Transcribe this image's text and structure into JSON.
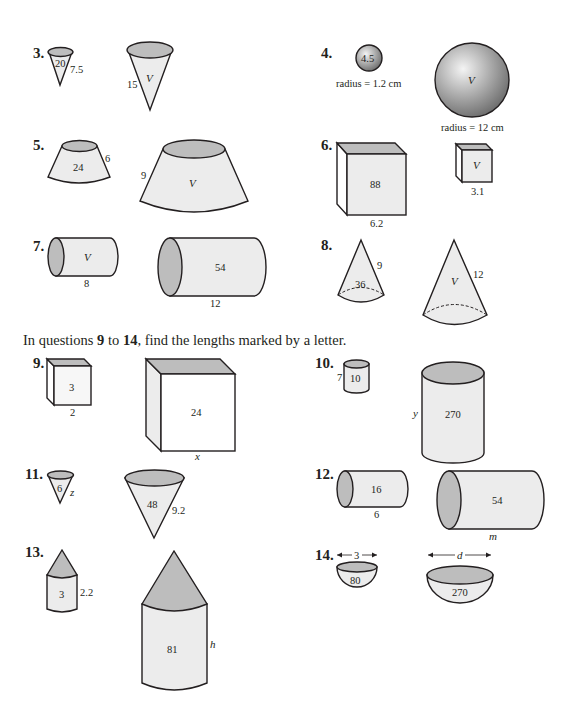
{
  "instruction": {
    "prefix": "In questions ",
    "from": "9",
    "middle": " to ",
    "to": "14",
    "suffix": ", find the lengths marked by a letter."
  },
  "questions": [
    {
      "number": "3.",
      "shape": "cone",
      "small": {
        "value": "20",
        "length": "7.5"
      },
      "large": {
        "value": "V",
        "length": "15"
      }
    },
    {
      "number": "4.",
      "shape": "sphere",
      "small": {
        "value": "4.5",
        "caption": "radius = 1.2 cm"
      },
      "large": {
        "value": "V",
        "caption": "radius = 12 cm"
      }
    },
    {
      "number": "5.",
      "shape": "frustum",
      "small": {
        "value": "24",
        "length": "6"
      },
      "large": {
        "value": "V",
        "length": "9"
      }
    },
    {
      "number": "6.",
      "shape": "cube",
      "small": {
        "value": "88",
        "length": "6.2"
      },
      "large": {
        "value": "V",
        "length": "3.1"
      }
    },
    {
      "number": "7.",
      "shape": "cylinder",
      "small": {
        "value": "V",
        "length": "8"
      },
      "large": {
        "value": "54",
        "length": "12"
      }
    },
    {
      "number": "8.",
      "shape": "cone",
      "small": {
        "value": "36",
        "length": "9"
      },
      "large": {
        "value": "V",
        "length": "12"
      }
    },
    {
      "number": "9.",
      "shape": "cube",
      "small": {
        "value": "3",
        "length": "2"
      },
      "large": {
        "value": "24",
        "length": "x"
      }
    },
    {
      "number": "10.",
      "shape": "cylinder",
      "small": {
        "value": "10",
        "length": "7"
      },
      "large": {
        "value": "270",
        "length": "y"
      }
    },
    {
      "number": "11.",
      "shape": "cone",
      "small": {
        "value": "6",
        "length": "z"
      },
      "large": {
        "value": "48",
        "length": "9.2"
      }
    },
    {
      "number": "12.",
      "shape": "cylinder",
      "small": {
        "value": "16",
        "length": "6"
      },
      "large": {
        "value": "54",
        "length": "m"
      }
    },
    {
      "number": "13.",
      "shape": "cone-on-cylinder",
      "small": {
        "value": "3",
        "length": "2.2"
      },
      "large": {
        "value": "81",
        "length": "h"
      }
    },
    {
      "number": "14.",
      "shape": "hemisphere",
      "small": {
        "value": "80",
        "length": "3"
      },
      "large": {
        "value": "270",
        "length": "d"
      }
    }
  ],
  "colors": {
    "ink": "#231f20",
    "fill_light": "#ececec",
    "fill_mid": "#bdbdbd"
  }
}
